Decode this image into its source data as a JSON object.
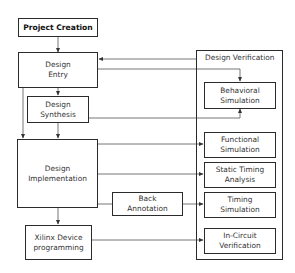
{
  "diagram": {
    "nodes": {
      "project_creation": "Project Creation",
      "design_entry": "Design\nEntry",
      "design_synthesis": "Design\nSynthesis",
      "design_implementation": "Design\nImplementation",
      "xilinx_device_programming": "Xilinx Device\nprogramming",
      "back_annotation": "Back\nAnnotation"
    },
    "verification": {
      "title": "Design Verification",
      "items": [
        "Behavioral\nSimulation",
        "Functional\nSimulation",
        "Static Timing\nAnalysis",
        "Timing\nSimulation",
        "In-Circuit\nVerification"
      ]
    },
    "edges": [
      {
        "from": "Project Creation",
        "to": "Design Entry"
      },
      {
        "from": "Design Entry",
        "to": "Design Synthesis"
      },
      {
        "from": "Design Entry",
        "to": "Design Implementation"
      },
      {
        "from": "Design Synthesis",
        "to": "Design Implementation"
      },
      {
        "from": "Design Implementation",
        "to": "Xilinx Device programming"
      },
      {
        "from": "Design Verification",
        "to": "Design Entry"
      },
      {
        "from": "Design Entry",
        "to": "Behavioral Simulation"
      },
      {
        "from": "Design Synthesis",
        "to": "Behavioral Simulation"
      },
      {
        "from": "Design Implementation",
        "to": "Functional Simulation"
      },
      {
        "from": "Design Implementation",
        "to": "Static Timing Analysis"
      },
      {
        "from": "Design Implementation",
        "to": "Back Annotation"
      },
      {
        "from": "Back Annotation",
        "to": "Timing Simulation"
      },
      {
        "from": "Xilinx Device programming",
        "to": "In-Circuit Verification"
      }
    ],
    "colors": {
      "line": "#555555",
      "border": "#2b2b2b",
      "background": "#ffffff"
    }
  }
}
